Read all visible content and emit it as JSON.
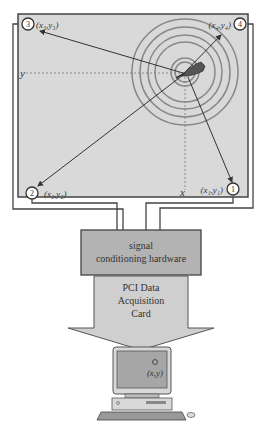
{
  "diagram": {
    "panel": {
      "fill": "#d9d9d9",
      "axis_x_label": "x",
      "axis_y_label": "y"
    },
    "sensors": [
      {
        "id": "1",
        "coord": "(x₁,y₁)"
      },
      {
        "id": "2",
        "coord": "(x₂,y₂)"
      },
      {
        "id": "3",
        "coord": "(x₃,y₃)"
      },
      {
        "id": "4",
        "coord": "(x₄,y₄)"
      }
    ],
    "signal_box": {
      "line1": "signal",
      "line2": "conditioning hardware",
      "fill": "#b3b3b3"
    },
    "daq_arrow": {
      "line1": "PCI Data",
      "line2": "Acquisition",
      "line3": "Card",
      "fill": "#cfcfcf"
    },
    "computer": {
      "screen_label": "(x,y)",
      "screen_fill": "#a6a6a6"
    }
  }
}
